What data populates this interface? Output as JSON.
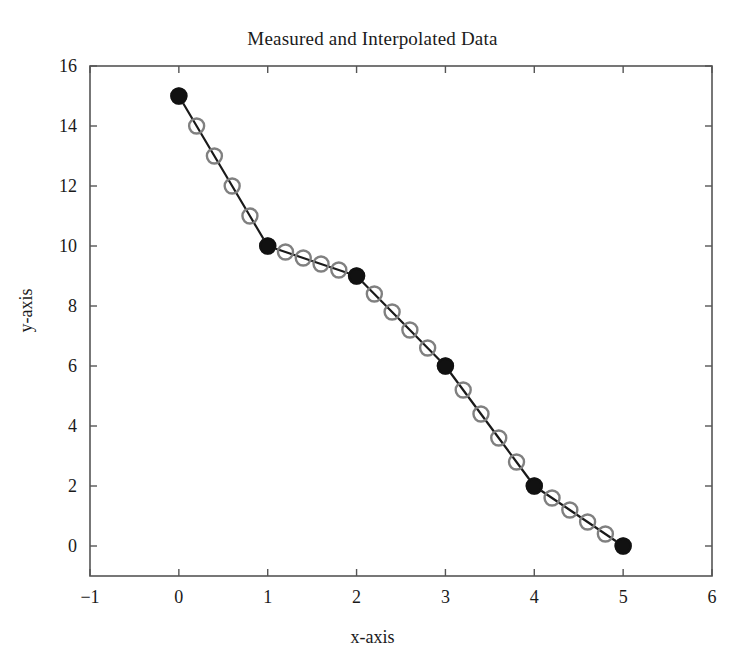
{
  "chart_data": {
    "type": "line",
    "title": "Measured and Interpolated Data",
    "xlabel": "x-axis",
    "ylabel": "y-axis",
    "xlim": [
      -1,
      6
    ],
    "ylim": [
      -1,
      16
    ],
    "grid": false,
    "legend": "none",
    "xticks": [
      -1,
      0,
      1,
      2,
      3,
      4,
      5,
      6
    ],
    "xtick_labels": [
      "−1",
      "0",
      "1",
      "2",
      "3",
      "4",
      "5",
      "6"
    ],
    "yticks": [
      0,
      2,
      4,
      6,
      8,
      10,
      12,
      14,
      16
    ],
    "ytick_labels": [
      "0",
      "2",
      "4",
      "6",
      "8",
      "10",
      "12",
      "14",
      "16"
    ],
    "series": [
      {
        "name": "Interpolated Data",
        "marker": "open-circle",
        "color": "#808080",
        "line_color": "#1a1a1a",
        "x": [
          0,
          0.2,
          0.4,
          0.6,
          0.8,
          1,
          1.2,
          1.4,
          1.6,
          1.8,
          2,
          2.2,
          2.4,
          2.6,
          2.8,
          3,
          3.2,
          3.4,
          3.6,
          3.8,
          4,
          4.2,
          4.4,
          4.6,
          4.8,
          5
        ],
        "y": [
          15,
          14,
          13,
          12,
          11,
          10,
          9.8,
          9.6,
          9.4,
          9.2,
          9,
          8.4,
          7.8,
          7.2,
          6.6,
          6,
          5.2,
          4.4,
          3.6,
          2.8,
          2,
          1.6,
          1.2,
          0.8,
          0.4,
          0
        ]
      },
      {
        "name": "Measured Data",
        "marker": "filled-circle",
        "color": "#111111",
        "x": [
          0,
          1,
          2,
          3,
          4,
          5
        ],
        "y": [
          15,
          10,
          9,
          6,
          2,
          0
        ]
      }
    ]
  },
  "figure": {
    "background": "#ffffff",
    "axis_color": "#555555"
  }
}
